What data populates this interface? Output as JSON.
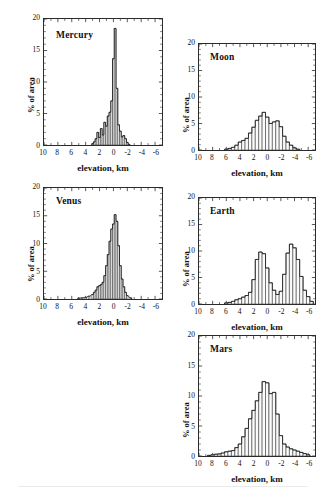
{
  "figure": {
    "axis": {
      "xlabel": "elevation, km",
      "ylabel": "% of area",
      "xticks": [
        "10",
        "8",
        "6",
        "4",
        "2",
        "0",
        "-2",
        "-4",
        "-6"
      ],
      "xtick_values": [
        10,
        8,
        6,
        4,
        2,
        0,
        -2,
        -4,
        -6
      ],
      "yticks": [
        "0",
        "5",
        "10",
        "15",
        "20"
      ],
      "ytick_values": [
        0,
        5,
        10,
        15,
        20
      ],
      "xlim": [
        10,
        -7
      ],
      "ylim": [
        0,
        20
      ],
      "x_reversed": true,
      "grid": false
    },
    "panels": [
      {
        "name": "mercury",
        "title": "Mercury"
      },
      {
        "name": "moon",
        "title": "Moon"
      },
      {
        "name": "venus",
        "title": "Venus"
      },
      {
        "name": "earth",
        "title": "Earth"
      },
      {
        "name": "mars",
        "title": "Mars"
      }
    ]
  },
  "chart_data": [
    {
      "type": "bar",
      "name": "mercury",
      "title": "Mercury",
      "xlabel": "elevation, km",
      "ylabel": "% of area",
      "xlim": [
        10,
        -7
      ],
      "ylim": [
        0,
        20
      ],
      "bin_width": 0.25,
      "x": [
        3.0,
        2.75,
        2.5,
        2.25,
        2.0,
        1.75,
        1.5,
        1.25,
        1.0,
        0.75,
        0.5,
        0.25,
        0.0,
        -0.25,
        -0.5,
        -0.75,
        -1.0,
        -1.25,
        -1.5,
        -1.75,
        -2.0,
        -2.25
      ],
      "values": [
        0.2,
        0.5,
        1.0,
        2.0,
        1.2,
        2.6,
        1.6,
        3.6,
        3.0,
        4.6,
        5.2,
        7.0,
        13.7,
        18.5,
        9.0,
        3.2,
        2.2,
        1.3,
        1.5,
        1.0,
        0.4,
        0.1
      ]
    },
    {
      "type": "bar",
      "name": "moon",
      "title": "Moon",
      "xlabel": "elevation, km",
      "ylabel": "% of area",
      "xlim": [
        10,
        -7
      ],
      "ylim": [
        0,
        20
      ],
      "bin_width": 0.5,
      "x": [
        6.0,
        5.5,
        5.0,
        4.5,
        4.0,
        3.5,
        3.0,
        2.5,
        2.0,
        1.5,
        1.0,
        0.5,
        0.0,
        -0.5,
        -1.0,
        -1.5,
        -2.0,
        -2.5,
        -3.0,
        -3.5,
        -4.0,
        -4.5
      ],
      "values": [
        0.15,
        0.3,
        0.5,
        0.9,
        1.5,
        1.8,
        2.2,
        3.2,
        4.3,
        5.6,
        6.4,
        7.1,
        6.2,
        5.0,
        5.3,
        5.5,
        4.4,
        2.6,
        1.5,
        0.9,
        0.4,
        0.15
      ]
    },
    {
      "type": "bar",
      "name": "venus",
      "title": "Venus",
      "xlabel": "elevation, km",
      "ylabel": "% of area",
      "xlim": [
        10,
        -7
      ],
      "ylim": [
        0,
        20
      ],
      "bin_width": 0.25,
      "x": [
        5.0,
        4.5,
        4.0,
        3.5,
        3.0,
        2.75,
        2.5,
        2.25,
        2.0,
        1.75,
        1.5,
        1.25,
        1.0,
        0.75,
        0.5,
        0.25,
        0.0,
        -0.25,
        -0.5,
        -0.75,
        -1.0,
        -1.25,
        -1.5,
        -1.75,
        -2.0,
        -2.5
      ],
      "values": [
        0.15,
        0.2,
        0.3,
        0.5,
        0.8,
        1.2,
        1.6,
        2.2,
        2.4,
        2.6,
        3.0,
        4.2,
        6.0,
        8.0,
        10.4,
        12.6,
        13.5,
        15.2,
        14.0,
        9.6,
        6.0,
        3.6,
        2.2,
        1.2,
        0.6,
        0.2
      ]
    },
    {
      "type": "bar",
      "name": "earth",
      "title": "Earth",
      "xlabel": "elevation, km",
      "ylabel": "% of area",
      "xlim": [
        10,
        -7
      ],
      "ylim": [
        0,
        20
      ],
      "bin_width": 0.5,
      "x": [
        6.0,
        5.5,
        5.0,
        4.5,
        4.0,
        3.5,
        3.0,
        2.5,
        2.0,
        1.5,
        1.0,
        0.5,
        0.0,
        -0.5,
        -1.0,
        -1.5,
        -2.0,
        -2.5,
        -3.0,
        -3.5,
        -4.0,
        -4.5,
        -5.0,
        -5.5,
        -6.0,
        -6.5
      ],
      "values": [
        0.2,
        0.3,
        0.5,
        0.8,
        1.0,
        1.3,
        1.6,
        2.2,
        4.6,
        8.4,
        9.8,
        9.5,
        6.8,
        4.0,
        2.6,
        1.8,
        2.4,
        5.6,
        9.6,
        11.3,
        10.6,
        8.4,
        5.2,
        2.6,
        1.4,
        0.5
      ]
    },
    {
      "type": "bar",
      "name": "mars",
      "title": "Mars",
      "xlabel": "elevation, km",
      "ylabel": "% of area",
      "xlim": [
        10,
        -7
      ],
      "ylim": [
        0,
        20
      ],
      "bin_width": 0.5,
      "x": [
        8.5,
        8.0,
        7.5,
        7.0,
        6.5,
        6.0,
        5.5,
        5.0,
        4.5,
        4.0,
        3.5,
        3.0,
        2.5,
        2.0,
        1.5,
        1.0,
        0.5,
        0.0,
        -0.5,
        -1.0,
        -1.5,
        -2.0,
        -2.5,
        -3.0,
        -3.5,
        -4.0,
        -4.5,
        -5.0,
        -5.5,
        -6.0
      ],
      "values": [
        0.1,
        0.2,
        0.3,
        0.35,
        0.5,
        0.7,
        0.8,
        0.9,
        1.4,
        2.0,
        3.2,
        4.6,
        6.2,
        7.6,
        9.2,
        10.6,
        12.4,
        12.2,
        10.4,
        10.6,
        7.0,
        3.4,
        2.0,
        1.5,
        1.2,
        1.0,
        0.8,
        0.6,
        0.4,
        0.2
      ]
    }
  ]
}
